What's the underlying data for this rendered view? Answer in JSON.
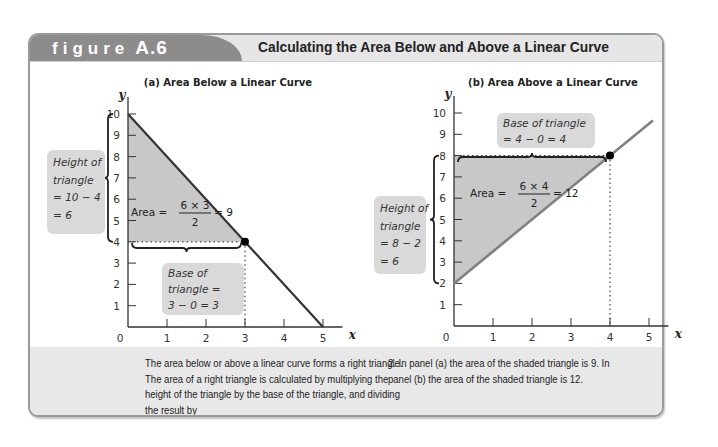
{
  "figure": {
    "tag_word": "figure",
    "tag_number": "A.6",
    "title": "Calculating the Area Below and Above a Linear Curve",
    "caption_col1": "The area below or above a linear curve forms a right triangle. The area of a right triangle is calculated by multiplying the height of the triangle by the base of the triangle, and dividing the result by",
    "caption_col2": "2. In panel (a) the area of the shaded triangle is 9. In panel (b) the area of the shaded triangle is 12.",
    "colors": {
      "tag": "#8c8c8c",
      "header": "#e6e6e6",
      "shade": "#c8c8c8",
      "line_a": "#333333",
      "line_b": "#808080",
      "note_bg": "#d9d9d9"
    }
  },
  "chart_data": [
    {
      "type": "line",
      "title": "(a) Area Below a Linear Curve",
      "xlabel": "x",
      "ylabel": "y",
      "xlim": [
        0,
        5
      ],
      "ylim": [
        0,
        10
      ],
      "x_ticks": [
        "0",
        "1",
        "2",
        "3",
        "4",
        "5"
      ],
      "y_ticks": [
        "1",
        "2",
        "3",
        "4",
        "5",
        "6",
        "7",
        "8",
        "9",
        "10"
      ],
      "grid": false,
      "series": [
        {
          "name": "linear curve",
          "points": [
            [
              0,
              10
            ],
            [
              5,
              0
            ]
          ]
        }
      ],
      "point": [
        3,
        4
      ],
      "shaded_triangle": [
        [
          0,
          10
        ],
        [
          0,
          4
        ],
        [
          3,
          4
        ]
      ],
      "annotations": {
        "height_lines": [
          "Height of",
          "triangle",
          "= 10 − 4",
          "= 6"
        ],
        "base_lines": [
          "Base of",
          "triangle =",
          "3 − 0 = 3"
        ],
        "area_label": "Area =",
        "area_numerator": "6 × 3",
        "area_denominator": "2",
        "area_result": "= 9"
      }
    },
    {
      "type": "line",
      "title": "(b) Area Above a Linear Curve",
      "xlabel": "x",
      "ylabel": "y",
      "xlim": [
        0,
        5
      ],
      "ylim": [
        0,
        10
      ],
      "x_ticks": [
        "0",
        "1",
        "2",
        "3",
        "4",
        "5"
      ],
      "y_ticks": [
        "1",
        "2",
        "3",
        "4",
        "5",
        "6",
        "7",
        "8",
        "9",
        "10"
      ],
      "grid": false,
      "series": [
        {
          "name": "linear curve",
          "points": [
            [
              0,
              2
            ],
            [
              5.1,
              9.65
            ]
          ]
        }
      ],
      "point": [
        4,
        8
      ],
      "shaded_triangle": [
        [
          0,
          8
        ],
        [
          0,
          2
        ],
        [
          4,
          8
        ]
      ],
      "annotations": {
        "height_lines": [
          "Height of",
          "triangle",
          "= 8 − 2",
          "= 6"
        ],
        "base_lines": [
          "Base of triangle",
          "= 4 − 0 = 4"
        ],
        "area_label": "Area =",
        "area_numerator": "6 × 4",
        "area_denominator": "2",
        "area_result": "= 12"
      }
    }
  ]
}
